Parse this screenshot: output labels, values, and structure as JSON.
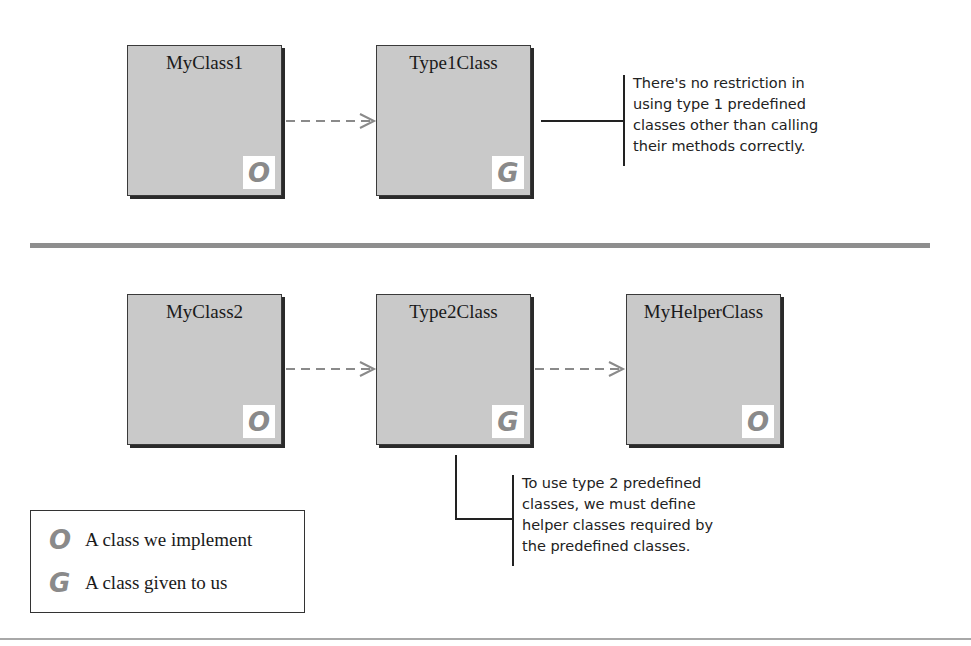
{
  "diagram": {
    "top_section": {
      "classes": [
        {
          "name": "MyClass1",
          "badge": "O",
          "kind": "implemented"
        },
        {
          "name": "Type1Class",
          "badge": "G",
          "kind": "given"
        }
      ],
      "arrows": [
        {
          "from": "MyClass1",
          "to": "Type1Class",
          "style": "dashed"
        }
      ],
      "note": "There's no restriction in\nusing type 1 predefined\nclasses other than calling\ntheir methods correctly."
    },
    "bottom_section": {
      "classes": [
        {
          "name": "MyClass2",
          "badge": "O",
          "kind": "implemented"
        },
        {
          "name": "Type2Class",
          "badge": "G",
          "kind": "given"
        },
        {
          "name": "MyHelperClass",
          "badge": "O",
          "kind": "implemented"
        }
      ],
      "arrows": [
        {
          "from": "MyClass2",
          "to": "Type2Class",
          "style": "dashed"
        },
        {
          "from": "Type2Class",
          "to": "MyHelperClass",
          "style": "dashed"
        }
      ],
      "note": "To use type 2 predefined\nclasses, we must define\nhelper classes required by\nthe predefined classes."
    },
    "legend": {
      "items": [
        {
          "glyph": "O",
          "label": "A class we implement"
        },
        {
          "glyph": "G",
          "label": "A class given to us"
        }
      ]
    },
    "colors": {
      "box_fill": "#c9c9c9",
      "box_border": "#3a3a3a",
      "badge_glyph": "#8a8a8a",
      "arrow": "#8a8a8a",
      "separator": "#8e8e8e"
    }
  }
}
